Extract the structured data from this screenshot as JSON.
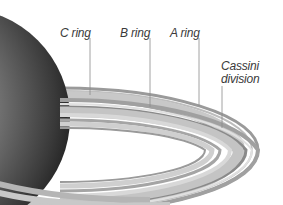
{
  "diagram": {
    "labels": [
      {
        "id": "c-ring",
        "text": "C ring"
      },
      {
        "id": "b-ring",
        "text": "B ring"
      },
      {
        "id": "a-ring",
        "text": "A ring"
      },
      {
        "id": "cassini-division",
        "text": "Cassini division",
        "line1": "Cassini",
        "line2": "division"
      }
    ],
    "colors": {
      "background": "#ffffff",
      "label_text": "#3a3a3a",
      "leader_line": "#8a8a8a",
      "planet_dark": "#1a1a1a",
      "planet_light": "#9a9a9a",
      "ring_light": "#d2d2d2",
      "ring_dark": "#8c8c8c"
    }
  }
}
